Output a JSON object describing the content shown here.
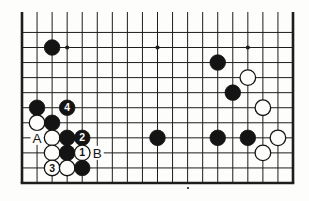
{
  "page": {
    "background": "#fdfdfb",
    "width": 309,
    "height": 201
  },
  "diagram": {
    "type": "go-board-diagram",
    "board": {
      "cols": 19,
      "visible_rows": 11,
      "left_px": 22,
      "right_px": 293,
      "bottom_px": 183,
      "top_cut_px": 12,
      "line_color": "#1d1d1d",
      "line_width": 1,
      "border_width": 2.6,
      "paper_color": "#fdfdfb",
      "stone_radius": 7.8,
      "star_radius": 2.1
    },
    "star_points": [
      {
        "col": 4,
        "row": 10
      },
      {
        "col": 10,
        "row": 10
      },
      {
        "col": 16,
        "row": 10
      }
    ],
    "stones": [
      {
        "col": 3,
        "row": 10,
        "color": "black"
      },
      {
        "col": 2,
        "row": 6,
        "color": "black"
      },
      {
        "col": 4,
        "row": 6,
        "color": "black",
        "number": "4"
      },
      {
        "col": 2,
        "row": 5,
        "color": "white"
      },
      {
        "col": 3,
        "row": 5,
        "color": "black"
      },
      {
        "col": 3,
        "row": 4,
        "color": "white"
      },
      {
        "col": 4,
        "row": 4,
        "color": "black"
      },
      {
        "col": 5,
        "row": 4,
        "color": "black",
        "number": "2"
      },
      {
        "col": 3,
        "row": 3,
        "color": "white"
      },
      {
        "col": 4,
        "row": 3,
        "color": "black"
      },
      {
        "col": 5,
        "row": 3,
        "color": "white",
        "number": "1"
      },
      {
        "col": 3,
        "row": 2,
        "color": "white",
        "number": "3"
      },
      {
        "col": 4,
        "row": 2,
        "color": "white"
      },
      {
        "col": 5,
        "row": 2,
        "color": "black"
      },
      {
        "col": 10,
        "row": 4,
        "color": "black"
      },
      {
        "col": 14,
        "row": 9,
        "color": "black"
      },
      {
        "col": 16,
        "row": 8,
        "color": "white"
      },
      {
        "col": 15,
        "row": 7,
        "color": "black"
      },
      {
        "col": 17,
        "row": 6,
        "color": "white"
      },
      {
        "col": 14,
        "row": 4,
        "color": "black"
      },
      {
        "col": 16,
        "row": 4,
        "color": "black"
      },
      {
        "col": 18,
        "row": 4,
        "color": "white"
      },
      {
        "col": 17,
        "row": 3,
        "color": "white"
      }
    ],
    "point_labels": [
      {
        "col": 2,
        "row": 4,
        "text": "A"
      },
      {
        "col": 6,
        "row": 3,
        "text": "B"
      }
    ],
    "artifacts": [
      {
        "name": "print-speck",
        "x": 188,
        "y": 188,
        "r": 1.1
      }
    ],
    "colors": {
      "black_stone": "#141414",
      "white_stone": "#fdfdfb",
      "stone_outline": "#141414",
      "number_on_black": "#fdfdfb",
      "number_on_white": "#141414",
      "label_text": "#141414"
    },
    "label_font_size": 13.5,
    "number_font_size": 10.5
  }
}
